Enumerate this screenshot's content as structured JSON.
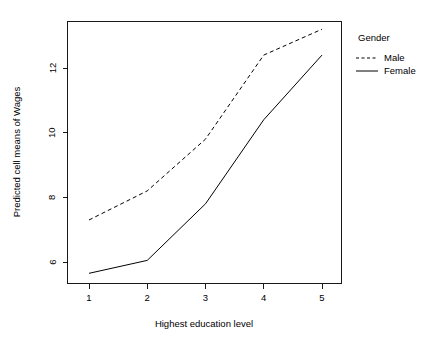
{
  "chart_data": {
    "type": "line",
    "title": "",
    "subtitle": "",
    "xlabel": "Highest education level",
    "ylabel": "Predicted cell means of Wages",
    "x": [
      1,
      2,
      3,
      4,
      5
    ],
    "xticklabels": [
      "1",
      "2",
      "3",
      "4",
      "5"
    ],
    "yticks": [
      6,
      8,
      10,
      12
    ],
    "yticklabels": [
      "6",
      "8",
      "10",
      "12"
    ],
    "xlim": [
      0.7,
      5.3
    ],
    "ylim": [
      5.4,
      13.5
    ],
    "grid": false,
    "legend_position": "right",
    "legend_title": "Gender",
    "series": [
      {
        "name": "Male",
        "style": "dashed",
        "color": "#000000",
        "values": [
          7.3,
          8.2,
          9.8,
          12.4,
          13.2
        ]
      },
      {
        "name": "Female",
        "style": "solid",
        "color": "#000000",
        "values": [
          5.65,
          6.05,
          7.8,
          10.4,
          12.4
        ]
      }
    ]
  },
  "axes": {
    "x_title": "Highest education level",
    "y_title": "Predicted cell means of Wages",
    "x_tick_labels": [
      "1",
      "2",
      "3",
      "4",
      "5"
    ],
    "y_tick_labels": [
      "6",
      "8",
      "10",
      "12"
    ]
  },
  "legend": {
    "title": "Gender",
    "entries": [
      {
        "label": "Male",
        "style": "dashed"
      },
      {
        "label": "Female",
        "style": "solid"
      }
    ]
  }
}
